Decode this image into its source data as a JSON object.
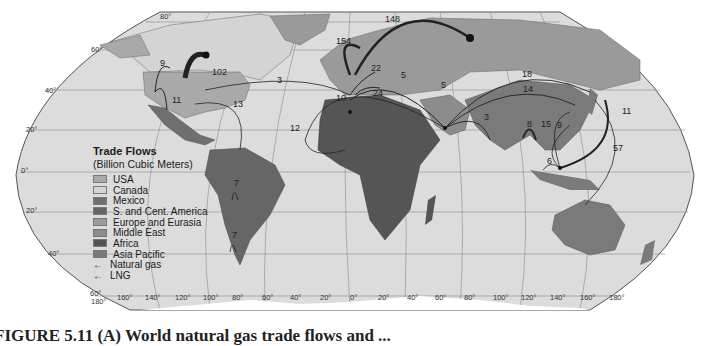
{
  "legend": {
    "title": "Trade Flows",
    "subtitle": "(Billion Cubic Meters)",
    "regions": [
      {
        "label": "USA",
        "color": "#a9a9a9"
      },
      {
        "label": "Canada",
        "color": "#d4d4d4"
      },
      {
        "label": "Mexico",
        "color": "#6f6f6f"
      },
      {
        "label": "S. and Cent. America",
        "color": "#666666"
      },
      {
        "label": "Europe and Eurasia",
        "color": "#9a9a9a"
      },
      {
        "label": "Middle East",
        "color": "#8c8c8c"
      },
      {
        "label": "Africa",
        "color": "#555555"
      },
      {
        "label": "Asia Pacific",
        "color": "#7a7a7a"
      }
    ],
    "line_types": [
      {
        "label": "Natural gas",
        "symbol": "←"
      },
      {
        "label": "LNG",
        "symbol": "←"
      }
    ]
  },
  "flow_labels": [
    {
      "value": "102",
      "x": 212,
      "y": 75
    },
    {
      "value": "9",
      "x": 160,
      "y": 66
    },
    {
      "value": "11",
      "x": 172,
      "y": 103
    },
    {
      "value": "3",
      "x": 277,
      "y": 83
    },
    {
      "value": "13",
      "x": 233,
      "y": 107
    },
    {
      "value": "12",
      "x": 290,
      "y": 131
    },
    {
      "value": "154",
      "x": 336,
      "y": 44
    },
    {
      "value": "148",
      "x": 385,
      "y": 22
    },
    {
      "value": "22",
      "x": 371,
      "y": 71
    },
    {
      "value": "10",
      "x": 336,
      "y": 101
    },
    {
      "value": "5",
      "x": 401,
      "y": 78
    },
    {
      "value": "5",
      "x": 441,
      "y": 88
    },
    {
      "value": "24",
      "x": 373,
      "y": 96
    },
    {
      "value": "18",
      "x": 522,
      "y": 77
    },
    {
      "value": "14",
      "x": 523,
      "y": 92
    },
    {
      "value": "3",
      "x": 484,
      "y": 120
    },
    {
      "value": "8",
      "x": 527,
      "y": 127
    },
    {
      "value": "15",
      "x": 541,
      "y": 127
    },
    {
      "value": "9",
      "x": 557,
      "y": 128
    },
    {
      "value": "11",
      "x": 622,
      "y": 114
    },
    {
      "value": "6",
      "x": 547,
      "y": 164
    },
    {
      "value": "57",
      "x": 613,
      "y": 151
    },
    {
      "value": "7",
      "x": 234,
      "y": 186
    },
    {
      "value": "7",
      "x": 232,
      "y": 238
    }
  ],
  "latitude_labels": [
    {
      "text": "80°",
      "x": 160,
      "y": 19
    },
    {
      "text": "60°",
      "x": 91,
      "y": 52
    },
    {
      "text": "40°",
      "x": 45,
      "y": 93
    },
    {
      "text": "20°",
      "x": 26,
      "y": 132
    },
    {
      "text": "0°",
      "x": 21,
      "y": 173
    },
    {
      "text": "20°",
      "x": 26,
      "y": 213
    },
    {
      "text": "40°",
      "x": 48,
      "y": 256
    },
    {
      "text": "60°",
      "x": 90,
      "y": 296
    }
  ],
  "longitude_labels": [
    {
      "text": "180°",
      "x": 91,
      "y": 304
    },
    {
      "text": "160°",
      "x": 117,
      "y": 300
    },
    {
      "text": "140°",
      "x": 145,
      "y": 300
    },
    {
      "text": "120°",
      "x": 175,
      "y": 300
    },
    {
      "text": "100°",
      "x": 203,
      "y": 300
    },
    {
      "text": "80°",
      "x": 232,
      "y": 300
    },
    {
      "text": "60°",
      "x": 262,
      "y": 300
    },
    {
      "text": "40°",
      "x": 290,
      "y": 300
    },
    {
      "text": "20°",
      "x": 320,
      "y": 300
    },
    {
      "text": "0°",
      "x": 350,
      "y": 300
    },
    {
      "text": "20°",
      "x": 378,
      "y": 300
    },
    {
      "text": "40°",
      "x": 407,
      "y": 300
    },
    {
      "text": "60°",
      "x": 435,
      "y": 300
    },
    {
      "text": "80°",
      "x": 464,
      "y": 300
    },
    {
      "text": "100°",
      "x": 493,
      "y": 300
    },
    {
      "text": "120°",
      "x": 521,
      "y": 300
    },
    {
      "text": "140°",
      "x": 550,
      "y": 300
    },
    {
      "text": "160°",
      "x": 580,
      "y": 300
    },
    {
      "text": "180°",
      "x": 609,
      "y": 300
    }
  ],
  "caption": "FIGURE 5.11 (A) World natural gas trade flows and ..."
}
